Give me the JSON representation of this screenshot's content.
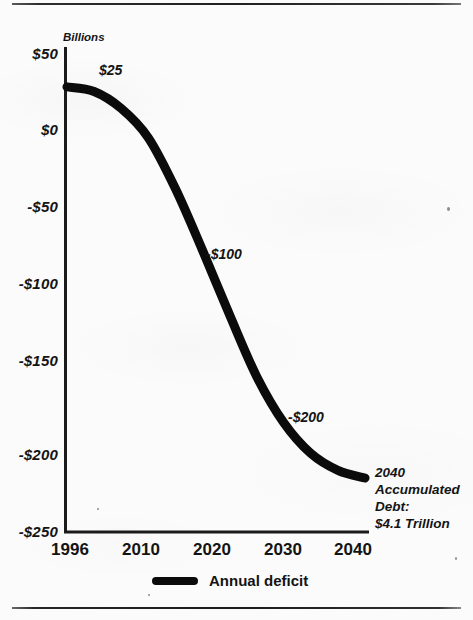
{
  "figure": {
    "axis_unit_label": "Billions",
    "legend": {
      "label": "Annual deficit",
      "swatch_icon": "thick-line-swatch"
    },
    "end_note_lines": [
      "2040",
      "Accumulated",
      "Debt:",
      "$4.1 Trillion"
    ],
    "colors": {
      "line": "#0b0b0b",
      "axis": "#1b1b1b",
      "text": "#141414",
      "background": "#fbfbfb"
    }
  },
  "chart_data": {
    "type": "line",
    "title": "",
    "subtitle": "",
    "xlabel": "",
    "ylabel": "Billions",
    "grid": false,
    "legend_position": "bottom-center",
    "xlim": [
      1996,
      2040
    ],
    "ylim": [
      -250,
      50
    ],
    "x_tick_labels": [
      "1996",
      "2010",
      "2020",
      "2030",
      "2040"
    ],
    "x_ticks": [
      1996,
      2010,
      2020,
      2030,
      2040
    ],
    "y_tick_labels": [
      "$50",
      "$0",
      "-$50",
      "-$100",
      "-$150",
      "-$200",
      "-$250"
    ],
    "y_ticks": [
      50,
      0,
      -50,
      -100,
      -150,
      -200,
      -250
    ],
    "annotations": [
      {
        "text": "$25",
        "value": 25,
        "near_x": 1999
      },
      {
        "text": "-$100",
        "value": -100,
        "near_x": 2018
      },
      {
        "text": "-$200",
        "value": -200,
        "near_x": 2031
      },
      {
        "text": "2040 Accumulated Debt: $4.1 Trillion",
        "value": -225,
        "near_x": 2040
      }
    ],
    "series": [
      {
        "name": "Annual deficit",
        "x": [
          1996,
          2000,
          2004,
          2008,
          2012,
          2016,
          2020,
          2024,
          2028,
          2032,
          2036,
          2040
        ],
        "values": [
          28,
          25,
          14,
          -5,
          -38,
          -78,
          -120,
          -160,
          -190,
          -210,
          -221,
          -226
        ]
      }
    ]
  }
}
